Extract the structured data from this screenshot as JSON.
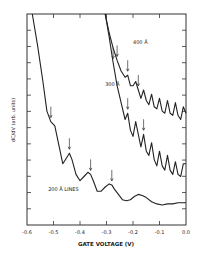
{
  "chart_data": {
    "type": "line",
    "title": "",
    "xlabel": "GATE VOLTAGE (V)",
    "ylabel": "dC/dV (arb. units)",
    "xlim": [
      -0.6,
      0.0
    ],
    "ylim": [
      0,
      10
    ],
    "x_ticks": [
      "-0.6",
      "-0.5",
      "-0.4",
      "-0.3",
      "-0.2",
      "-0.1",
      "0.0"
    ],
    "grid": false,
    "legend": "none (inline curve labels)",
    "series": [
      {
        "name": "200 Å LINES",
        "label_pos": [
          -0.52,
          1.6
        ],
        "x": [
          -0.58,
          -0.56,
          -0.54,
          -0.525,
          -0.51,
          -0.495,
          -0.48,
          -0.465,
          -0.45,
          -0.44,
          -0.43,
          -0.415,
          -0.4,
          -0.385,
          -0.37,
          -0.36,
          -0.35,
          -0.335,
          -0.32,
          -0.305,
          -0.29,
          -0.28,
          -0.27,
          -0.255,
          -0.24,
          -0.225,
          -0.21,
          -0.195,
          -0.18,
          -0.165,
          -0.15,
          -0.13,
          -0.11,
          -0.09,
          -0.07,
          -0.05,
          -0.03,
          0.0
        ],
        "y": [
          10.0,
          8.5,
          6.8,
          5.4,
          4.9,
          4.7,
          3.8,
          2.9,
          3.2,
          3.4,
          3.1,
          2.4,
          2.1,
          2.3,
          2.5,
          2.4,
          2.1,
          1.6,
          1.6,
          1.8,
          1.95,
          1.9,
          1.7,
          1.45,
          1.2,
          1.15,
          1.2,
          1.35,
          1.45,
          1.4,
          1.3,
          1.1,
          1.0,
          0.95,
          1.0,
          1.0,
          1.05,
          1.05
        ],
        "arrows_x": [
          -0.51,
          -0.44,
          -0.36,
          -0.28
        ]
      },
      {
        "name": "300 Å",
        "label_pos": [
          -0.305,
          6.6
        ],
        "x": [
          -0.305,
          -0.29,
          -0.275,
          -0.26,
          -0.245,
          -0.23,
          -0.22,
          -0.21,
          -0.2,
          -0.19,
          -0.18,
          -0.17,
          -0.16,
          -0.15,
          -0.14,
          -0.13,
          -0.12,
          -0.11,
          -0.1,
          -0.09,
          -0.08,
          -0.07,
          -0.06,
          -0.05,
          -0.04,
          -0.03,
          -0.02,
          -0.01,
          0.0
        ],
        "y": [
          10.0,
          8.9,
          7.7,
          6.6,
          5.8,
          5.0,
          5.3,
          4.5,
          4.2,
          4.9,
          4.3,
          3.7,
          4.3,
          3.5,
          3.3,
          3.9,
          3.1,
          2.8,
          3.5,
          2.8,
          2.6,
          3.3,
          2.6,
          2.4,
          3.0,
          2.4,
          2.3,
          2.9,
          2.9
        ],
        "arrows_x": [
          -0.275,
          -0.22,
          -0.16
        ]
      },
      {
        "name": "400 Å",
        "label_pos": [
          -0.2,
          8.6
        ],
        "x": [
          -0.305,
          -0.29,
          -0.275,
          -0.26,
          -0.245,
          -0.23,
          -0.22,
          -0.21,
          -0.2,
          -0.19,
          -0.18,
          -0.17,
          -0.16,
          -0.15,
          -0.14,
          -0.13,
          -0.12,
          -0.11,
          -0.1,
          -0.09,
          -0.08,
          -0.07,
          -0.06,
          -0.05,
          -0.04,
          -0.03,
          -0.02,
          -0.01,
          0.0
        ],
        "y": [
          10.0,
          9.1,
          8.4,
          7.8,
          7.3,
          7.0,
          7.1,
          6.6,
          6.6,
          6.8,
          6.4,
          6.0,
          6.4,
          5.9,
          5.7,
          6.2,
          5.6,
          5.5,
          6.0,
          5.4,
          5.3,
          5.9,
          5.3,
          5.2,
          5.8,
          5.2,
          5.0,
          5.6,
          5.3
        ],
        "arrows_x": [
          -0.26,
          -0.22,
          -0.18
        ]
      }
    ]
  }
}
